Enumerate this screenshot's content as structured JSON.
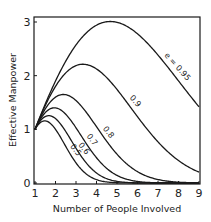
{
  "chart_data": {
    "type": "line",
    "title": "",
    "xlabel": "Number of People Involved",
    "ylabel": "Effective Manpower",
    "xlim": [
      1,
      9
    ],
    "ylim": [
      0,
      3.1
    ],
    "x_ticks": [
      "1",
      "2",
      "3",
      "4",
      "5",
      "6",
      "7",
      "8",
      "9"
    ],
    "y_ticks": [
      "0",
      "1",
      "2",
      "3"
    ],
    "grid": false,
    "legend": "inline curve labels",
    "x": [
      1,
      2,
      3,
      4,
      5,
      6,
      7,
      8,
      9
    ],
    "series": [
      {
        "name": "e = 0.95",
        "label": "e = 0.95",
        "e": 0.95,
        "values": [
          1.0,
          1.9,
          2.57,
          2.94,
          2.99,
          2.77,
          2.37,
          1.86,
          1.4
        ]
      },
      {
        "name": "0.9",
        "label": "0.9",
        "e": 0.9,
        "values": [
          1.0,
          1.8,
          2.19,
          2.13,
          1.74,
          1.24,
          0.76,
          0.42,
          0.2
        ]
      },
      {
        "name": "0.8",
        "label": "0.8",
        "e": 0.8,
        "values": [
          1.0,
          1.6,
          1.54,
          1.07,
          0.54,
          0.19,
          0.05,
          0.01,
          0.0
        ]
      },
      {
        "name": "0.7",
        "label": "0.7",
        "e": 0.7,
        "values": [
          1.0,
          1.4,
          1.03,
          0.47,
          0.14,
          0.03,
          0.0,
          0.0,
          0.0
        ]
      },
      {
        "name": "0.6",
        "label": "0.6",
        "e": 0.6,
        "values": [
          1.0,
          1.2,
          0.65,
          0.19,
          0.03,
          0.0,
          0.0,
          0.0,
          0.0
        ]
      },
      {
        "name": "0.5",
        "label": "0.5",
        "e": 0.5,
        "values": [
          1.0,
          1.0,
          0.38,
          0.06,
          0.01,
          0.0,
          0.0,
          0.0,
          0.0
        ]
      }
    ]
  }
}
